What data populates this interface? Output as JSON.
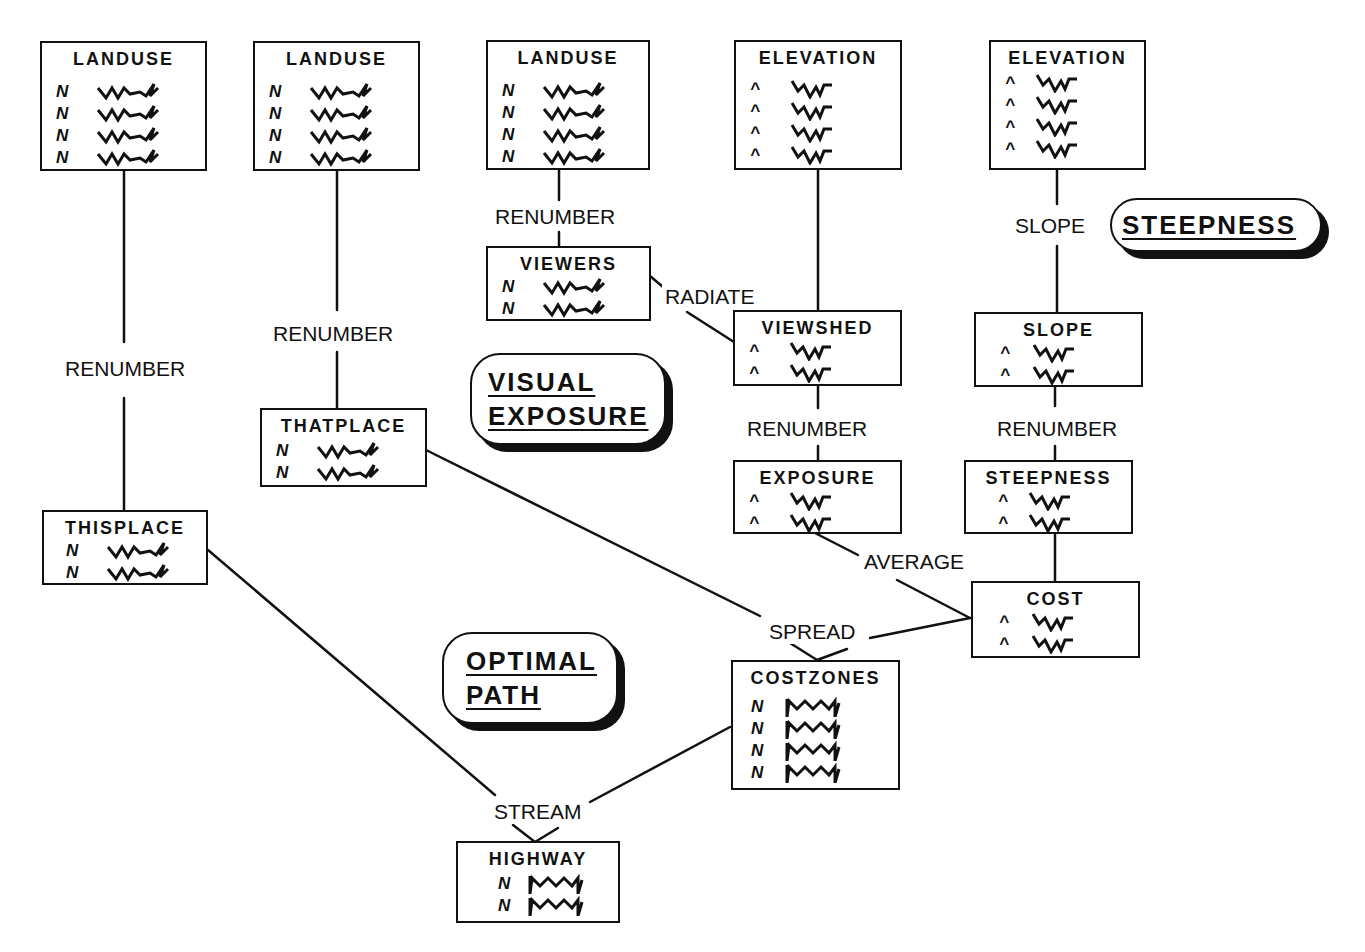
{
  "diagram": {
    "type": "flowchart"
  },
  "nodes": {
    "landuse1": {
      "title": "LANDUSE",
      "rows": 4,
      "symbol": "N"
    },
    "landuse2": {
      "title": "LANDUSE",
      "rows": 4,
      "symbol": "N"
    },
    "landuse3": {
      "title": "LANDUSE",
      "rows": 4,
      "symbol": "N"
    },
    "elevation1": {
      "title": "ELEVATION",
      "rows": 4,
      "symbol": "^"
    },
    "elevation2": {
      "title": "ELEVATION",
      "rows": 4,
      "symbol": "^"
    },
    "viewers": {
      "title": "VIEWERS",
      "rows": 2,
      "symbol": "N"
    },
    "viewshed": {
      "title": "VIEWSHED",
      "rows": 2,
      "symbol": "^"
    },
    "slope": {
      "title": "SLOPE",
      "rows": 2,
      "symbol": "^"
    },
    "thatplace": {
      "title": "THATPLACE",
      "rows": 2,
      "symbol": "N"
    },
    "exposure": {
      "title": "EXPOSURE",
      "rows": 2,
      "symbol": "^"
    },
    "steepness": {
      "title": "STEEPNESS",
      "rows": 2,
      "symbol": "^"
    },
    "thisplace": {
      "title": "THISPLACE",
      "rows": 2,
      "symbol": "N"
    },
    "cost": {
      "title": "COST",
      "rows": 2,
      "symbol": "^"
    },
    "costzones": {
      "title": "COSTZONES",
      "rows": 4,
      "symbol": "N"
    },
    "highway": {
      "title": "HIGHWAY",
      "rows": 2,
      "symbol": "N"
    }
  },
  "operations": {
    "renumber_thisplace": "RENUMBER",
    "renumber_thatplace": "RENUMBER",
    "renumber_viewers": "RENUMBER",
    "radiate": "RADIATE",
    "slope": "SLOPE",
    "renumber_exposure": "RENUMBER",
    "renumber_steepness": "RENUMBER",
    "average": "AVERAGE",
    "spread": "SPREAD",
    "stream": "STREAM"
  },
  "edges": [
    {
      "from": "landuse1",
      "to": "thisplace",
      "op": "RENUMBER"
    },
    {
      "from": "landuse2",
      "to": "thatplace",
      "op": "RENUMBER"
    },
    {
      "from": "landuse3",
      "to": "viewers",
      "op": "RENUMBER"
    },
    {
      "from": "viewers",
      "to": "viewshed",
      "op": "RADIATE"
    },
    {
      "from": "elevation1",
      "to": "viewshed",
      "op": "RADIATE"
    },
    {
      "from": "elevation2",
      "to": "slope",
      "op": "SLOPE"
    },
    {
      "from": "viewshed",
      "to": "exposure",
      "op": "RENUMBER"
    },
    {
      "from": "slope",
      "to": "steepness",
      "op": "RENUMBER"
    },
    {
      "from": "exposure",
      "to": "cost",
      "op": "AVERAGE"
    },
    {
      "from": "steepness",
      "to": "cost",
      "op": "AVERAGE"
    },
    {
      "from": "thatplace",
      "to": "costzones",
      "op": "SPREAD"
    },
    {
      "from": "cost",
      "to": "costzones",
      "op": "SPREAD"
    },
    {
      "from": "thisplace",
      "to": "highway",
      "op": "STREAM"
    },
    {
      "from": "costzones",
      "to": "highway",
      "op": "STREAM"
    }
  ],
  "badges": {
    "steepness": [
      "STEEPNESS"
    ],
    "visual_exposure": [
      "VISUAL",
      "EXPOSURE"
    ],
    "optimal_path": [
      "OPTIMAL",
      "PATH"
    ]
  },
  "colors": {
    "ink": "#111111",
    "background": "#ffffff"
  }
}
